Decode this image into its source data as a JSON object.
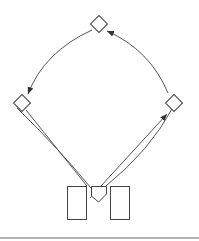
{
  "diagram": {
    "type": "node-link",
    "colors": {
      "stroke": "#444444",
      "edge": "#555555",
      "rule": "#9a9a9a",
      "background": "#ffffff"
    },
    "nodes": [
      {
        "id": "top-diamond",
        "shape": "diamond",
        "cx": 99,
        "cy": 24
      },
      {
        "id": "left-diamond",
        "shape": "diamond",
        "cx": 22,
        "cy": 103
      },
      {
        "id": "right-diamond",
        "shape": "diamond",
        "cx": 174,
        "cy": 103
      },
      {
        "id": "left-rect",
        "shape": "rect",
        "x": 67,
        "y": 186,
        "w": 20,
        "h": 34
      },
      {
        "id": "right-rect",
        "shape": "rect",
        "x": 110,
        "y": 186,
        "w": 20,
        "h": 34
      },
      {
        "id": "center-pentagon",
        "shape": "pentagon",
        "cx": 99,
        "cy": 193
      }
    ],
    "edges": [
      {
        "from": "top-diamond",
        "to": "left-diamond",
        "style": "curved",
        "arrow": "end"
      },
      {
        "from": "right-diamond",
        "to": "top-diamond",
        "style": "curved",
        "arrow": "end"
      },
      {
        "from": "left-diamond",
        "to": "center-pentagon",
        "style": "straight",
        "arrow": "none"
      },
      {
        "from": "left-diamond",
        "to": "center-pentagon",
        "style": "curved",
        "arrow": "none"
      },
      {
        "from": "center-pentagon",
        "to": "right-diamond",
        "style": "straight",
        "arrow": "end"
      },
      {
        "from": "center-pentagon",
        "to": "right-diamond",
        "style": "curved",
        "arrow": "none"
      }
    ]
  }
}
